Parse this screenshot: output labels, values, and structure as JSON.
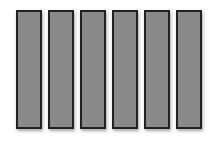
{
  "diagram": {
    "fill_color": "#8a8a8a",
    "border_color": "#222222",
    "bars": [
      {
        "left": 16
      },
      {
        "left": 48
      },
      {
        "left": 80
      },
      {
        "left": 112
      },
      {
        "left": 144
      },
      {
        "left": 176
      }
    ]
  }
}
